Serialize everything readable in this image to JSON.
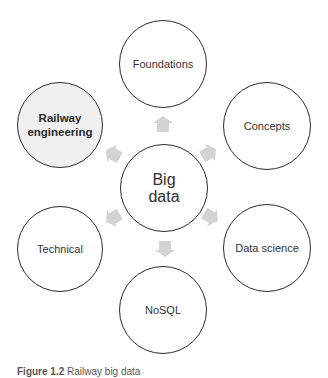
{
  "diagram": {
    "center": {
      "label": "Big data",
      "line1": "Big",
      "line2": "data"
    },
    "nodes": [
      {
        "id": "foundations",
        "label": "Foundations",
        "highlighted": false
      },
      {
        "id": "concepts",
        "label": "Concepts",
        "highlighted": false
      },
      {
        "id": "data-science",
        "label": "Data science",
        "highlighted": false
      },
      {
        "id": "nosql",
        "label": "NoSQL",
        "highlighted": false
      },
      {
        "id": "technical",
        "label": "Technical",
        "highlighted": false
      },
      {
        "id": "railway-engineering",
        "label": "Railway engineering",
        "line1": "Railway",
        "line2": "engineering",
        "highlighted": true
      }
    ],
    "arrows": [
      {
        "from": "Big data",
        "to": "Foundations",
        "direction": "up"
      },
      {
        "from": "Big data",
        "to": "Concepts",
        "direction": "up-right"
      },
      {
        "from": "Big data",
        "to": "Data science",
        "direction": "down-right"
      },
      {
        "from": "Big data",
        "to": "NoSQL",
        "direction": "down"
      },
      {
        "from": "Big data",
        "to": "Technical",
        "direction": "down-left"
      },
      {
        "from": "Big data",
        "to": "Railway engineering",
        "direction": "up-left"
      }
    ],
    "colors": {
      "circle_stroke": "#2b2b2b",
      "highlight_fill": "#f0f0f0",
      "arrow_fill": "#d3d3d3",
      "text": "#333333"
    }
  },
  "caption": {
    "figure_number": "Figure 1.2",
    "text": "Railway big data"
  }
}
